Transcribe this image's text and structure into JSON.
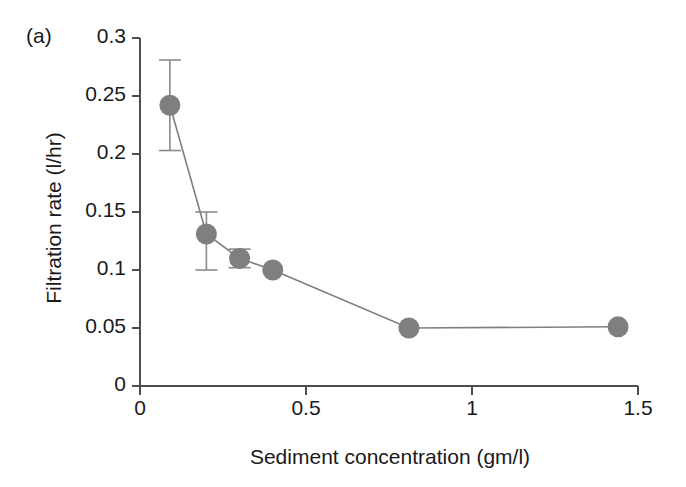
{
  "figure": {
    "panel_label": "(a)",
    "background_color": "#ffffff"
  },
  "chart_data": {
    "type": "line",
    "title": "",
    "panel": "(a)",
    "xlabel": "Sediment concentration (gm/l)",
    "ylabel": "Filtration rate (l/hr)",
    "xlim": [
      0,
      1.5
    ],
    "ylim": [
      0,
      0.3
    ],
    "xticks": [
      0,
      0.5,
      1,
      1.5
    ],
    "xticklabels": [
      "0",
      "0.5",
      "1",
      "1.5"
    ],
    "yticks": [
      0,
      0.05,
      0.1,
      0.15,
      0.2,
      0.25,
      0.3
    ],
    "yticklabels": [
      "0",
      "0.05",
      "0.1",
      "0.15",
      "0.2",
      "0.25",
      "0.3"
    ],
    "grid": false,
    "legend": "none",
    "marker": "filled-circle",
    "marker_color": "#7f7f7f",
    "line_color": "#7f7f7f",
    "errorbar_color": "#8a8a8a",
    "axis_color": "#4d4d4d",
    "x": [
      0.09,
      0.2,
      0.3,
      0.4,
      0.81,
      1.44
    ],
    "y": [
      0.242,
      0.131,
      0.11,
      0.1,
      0.05,
      0.051
    ],
    "yerr_upper": [
      0.039,
      0.019,
      0.008,
      0,
      0,
      0
    ],
    "yerr_lower": [
      0.039,
      0.031,
      0.008,
      0,
      0,
      0
    ],
    "points": [
      {
        "x": 0.09,
        "y": 0.242,
        "err_up": 0.039,
        "err_down": 0.039
      },
      {
        "x": 0.2,
        "y": 0.131,
        "err_up": 0.019,
        "err_down": 0.031
      },
      {
        "x": 0.3,
        "y": 0.11,
        "err_up": 0.008,
        "err_down": 0.008
      },
      {
        "x": 0.4,
        "y": 0.1,
        "err_up": 0,
        "err_down": 0
      },
      {
        "x": 0.81,
        "y": 0.05,
        "err_up": 0,
        "err_down": 0
      },
      {
        "x": 1.44,
        "y": 0.051,
        "err_up": 0,
        "err_down": 0
      }
    ]
  }
}
